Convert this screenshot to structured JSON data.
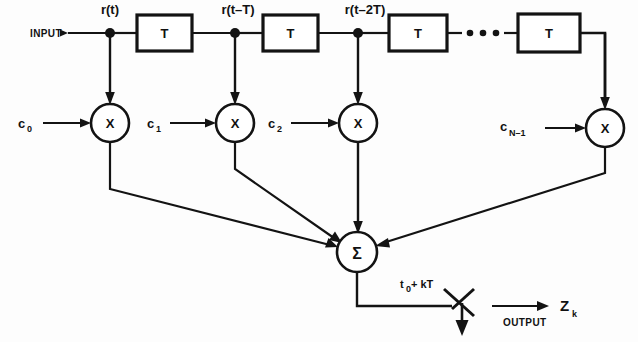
{
  "diagram": {
    "io": {
      "input_label": "INPUT",
      "output_label": "OUTPUT",
      "output_symbol": "Z",
      "output_subscript": "k"
    },
    "signal_labels": [
      {
        "id": "tap0",
        "text": "r(t)"
      },
      {
        "id": "tap1",
        "text": "r(t–T)"
      },
      {
        "id": "tap2",
        "text": "r(t–2T)"
      }
    ],
    "delay_blocks": [
      {
        "id": "delay1",
        "label": "T"
      },
      {
        "id": "delay2",
        "label": "T"
      },
      {
        "id": "delay3",
        "label": "T"
      },
      {
        "id": "delay4",
        "label": "T"
      }
    ],
    "ellipsis": "• • •",
    "multipliers": [
      {
        "id": "mult0",
        "label": "X"
      },
      {
        "id": "mult1",
        "label": "X"
      },
      {
        "id": "mult2",
        "label": "X"
      },
      {
        "id": "multN",
        "label": "X"
      }
    ],
    "coefficients": [
      {
        "id": "c0",
        "symbol": "c",
        "subscript": "0"
      },
      {
        "id": "c1",
        "symbol": "c",
        "subscript": "1"
      },
      {
        "id": "c2",
        "symbol": "c",
        "subscript": "2"
      },
      {
        "id": "cN",
        "symbol": "c",
        "subscript": "N–1"
      }
    ],
    "summer": {
      "id": "summer",
      "label": "Σ"
    },
    "sampler": {
      "label_prefix": "t",
      "label_subscript": "0",
      "label_suffix": " + kT"
    },
    "colors": {
      "ink": "#131313",
      "paper": "#fdfdfd"
    }
  }
}
